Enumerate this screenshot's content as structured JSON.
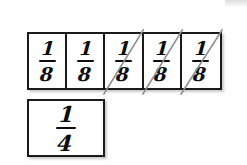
{
  "diagram": {
    "background_color": "#fefefe",
    "ink_color": "#0d0d0d",
    "strike_color": "#8e8e8e",
    "strip": {
      "name": "eighths-strip",
      "cells": [
        {
          "label_numerator": "1",
          "label_denominator": "8",
          "value": "1/8",
          "struck_out": false
        },
        {
          "label_numerator": "1",
          "label_denominator": "8",
          "value": "1/8",
          "struck_out": false
        },
        {
          "label_numerator": "1",
          "label_denominator": "8",
          "value": "1/8",
          "struck_out": true
        },
        {
          "label_numerator": "1",
          "label_denominator": "8",
          "value": "1/8",
          "struck_out": true
        },
        {
          "label_numerator": "1",
          "label_denominator": "8",
          "value": "1/8",
          "struck_out": true
        }
      ]
    },
    "single_box": {
      "name": "quarter-box",
      "label_numerator": "1",
      "label_denominator": "4",
      "value": "1/4"
    }
  }
}
